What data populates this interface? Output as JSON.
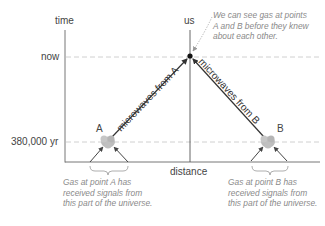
{
  "diagram": {
    "axes": {
      "y_label": "time",
      "x_label": "distance",
      "ticks": [
        {
          "label": "now"
        },
        {
          "label": "380,000 yr"
        }
      ]
    },
    "observer": {
      "label": "us"
    },
    "points": [
      {
        "label": "A",
        "microwave_label": "microwaves from A"
      },
      {
        "label": "B",
        "microwave_label": "microwaves from B"
      }
    ],
    "annotations": {
      "observer_note": [
        "We can see gas at points",
        "A and B before they knew",
        "about each other."
      ],
      "point_a_note": [
        "Gas at point A has",
        "received signals from",
        "this part of the universe."
      ],
      "point_b_note": [
        "Gas at point B has",
        "received signals from",
        "this part of the universe."
      ]
    },
    "colors": {
      "axis": "#555555",
      "dashed": "#bdbdbd",
      "arrow": "#333333",
      "gas": "#b8b8b8",
      "note": "#8a8a8a"
    }
  }
}
